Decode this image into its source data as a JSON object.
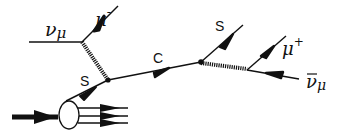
{
  "diagram": {
    "type": "feynman-diagram",
    "title": "",
    "labels": {
      "incoming_neutrino": "ν",
      "incoming_neutrino_sub": "μ",
      "muon_minus": "μ",
      "muon_minus_sup": "-",
      "strange_in": "S",
      "charm": "C",
      "strange_out": "S",
      "muon_plus": "μ",
      "muon_plus_sup": "+",
      "antineutrino": "ν",
      "antineutrino_sub": "μ"
    },
    "colors": {
      "ink": "#111111",
      "background": "#ffffff"
    },
    "nodes": [
      {
        "id": "v1",
        "label": "neutrino-W vertex"
      },
      {
        "id": "v2",
        "label": "s-W-c vertex"
      },
      {
        "id": "v3",
        "label": "c-W-s vertex"
      },
      {
        "id": "v4",
        "label": "W decay vertex"
      },
      {
        "id": "nucleon",
        "label": "target nucleon blob"
      }
    ],
    "edges": [
      {
        "from": "incoming",
        "to": "v1",
        "particle": "ν_μ",
        "style": "line"
      },
      {
        "from": "v1",
        "to": "out",
        "particle": "μ-",
        "style": "arrow"
      },
      {
        "from": "v1",
        "to": "v2",
        "particle": "W",
        "style": "wiggly"
      },
      {
        "from": "nucleon",
        "to": "v2",
        "particle": "s",
        "style": "arrow"
      },
      {
        "from": "v2",
        "to": "v3",
        "particle": "c",
        "style": "arrow"
      },
      {
        "from": "v3",
        "to": "out",
        "particle": "s",
        "style": "arrow"
      },
      {
        "from": "v3",
        "to": "v4",
        "particle": "W",
        "style": "wiggly"
      },
      {
        "from": "v4",
        "to": "out",
        "particle": "μ+",
        "style": "arrow"
      },
      {
        "from": "v4",
        "to": "out",
        "particle": "ν̄_μ",
        "style": "arrow-reversed"
      }
    ]
  }
}
